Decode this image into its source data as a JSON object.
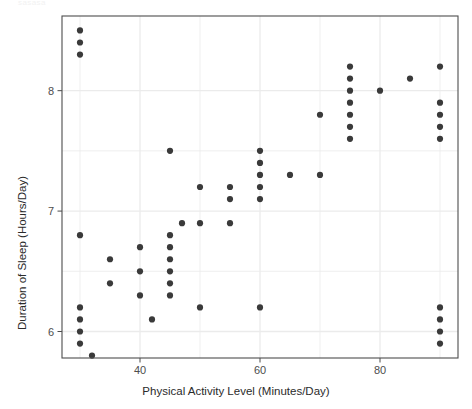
{
  "figure": {
    "faint_header_text": "sasasa",
    "background": "#ffffff",
    "panel_background": "#ffffff",
    "panel_border_color": "#4d4d4d",
    "grid_color": "#ebebeb",
    "point_color": "#3a3a3a",
    "tick_label_color": "#4d4d4d",
    "axis_label_color": "#2b2b2b"
  },
  "chart_data": {
    "type": "scatter",
    "title": "",
    "xlabel": "Physical Activity Level (Minutes/Day)",
    "ylabel": "Duration of Sleep (Hours/Day)",
    "xlim": [
      27,
      93
    ],
    "ylim": [
      5.78,
      8.62
    ],
    "xticks": [
      40,
      60,
      80
    ],
    "xtick_labels": [
      "40",
      "60",
      "80"
    ],
    "yticks": [
      6,
      7,
      8
    ],
    "ytick_labels": [
      "6",
      "7",
      "8"
    ],
    "x_minor_ticks": [
      30,
      50,
      70,
      90
    ],
    "y_minor_ticks": [
      6.5,
      7.5
    ],
    "grid": true,
    "legend": "none",
    "marker": "filled-circle",
    "marker_size": 3.1,
    "points": [
      {
        "x": 30,
        "y": 8.5
      },
      {
        "x": 30,
        "y": 8.4
      },
      {
        "x": 30,
        "y": 8.3
      },
      {
        "x": 30,
        "y": 6.8
      },
      {
        "x": 30,
        "y": 6.2
      },
      {
        "x": 30,
        "y": 6.1
      },
      {
        "x": 30,
        "y": 6.0
      },
      {
        "x": 30,
        "y": 5.9
      },
      {
        "x": 32,
        "y": 5.8
      },
      {
        "x": 35,
        "y": 6.6
      },
      {
        "x": 35,
        "y": 6.4
      },
      {
        "x": 40,
        "y": 6.7
      },
      {
        "x": 40,
        "y": 6.5
      },
      {
        "x": 40,
        "y": 6.3
      },
      {
        "x": 42,
        "y": 6.1
      },
      {
        "x": 45,
        "y": 7.5
      },
      {
        "x": 45,
        "y": 6.8
      },
      {
        "x": 45,
        "y": 6.7
      },
      {
        "x": 45,
        "y": 6.6
      },
      {
        "x": 45,
        "y": 6.5
      },
      {
        "x": 45,
        "y": 6.4
      },
      {
        "x": 45,
        "y": 6.3
      },
      {
        "x": 47,
        "y": 6.9
      },
      {
        "x": 50,
        "y": 7.2
      },
      {
        "x": 50,
        "y": 6.9
      },
      {
        "x": 50,
        "y": 6.2
      },
      {
        "x": 55,
        "y": 7.2
      },
      {
        "x": 55,
        "y": 7.1
      },
      {
        "x": 55,
        "y": 6.9
      },
      {
        "x": 60,
        "y": 7.5
      },
      {
        "x": 60,
        "y": 7.4
      },
      {
        "x": 60,
        "y": 7.3
      },
      {
        "x": 60,
        "y": 7.2
      },
      {
        "x": 60,
        "y": 7.1
      },
      {
        "x": 60,
        "y": 6.2
      },
      {
        "x": 65,
        "y": 7.3
      },
      {
        "x": 70,
        "y": 7.8
      },
      {
        "x": 70,
        "y": 7.3
      },
      {
        "x": 75,
        "y": 8.2
      },
      {
        "x": 75,
        "y": 8.1
      },
      {
        "x": 75,
        "y": 8.0
      },
      {
        "x": 75,
        "y": 7.9
      },
      {
        "x": 75,
        "y": 7.8
      },
      {
        "x": 75,
        "y": 7.7
      },
      {
        "x": 75,
        "y": 7.6
      },
      {
        "x": 80,
        "y": 8.0
      },
      {
        "x": 85,
        "y": 8.1
      },
      {
        "x": 90,
        "y": 8.2
      },
      {
        "x": 90,
        "y": 7.9
      },
      {
        "x": 90,
        "y": 7.8
      },
      {
        "x": 90,
        "y": 7.7
      },
      {
        "x": 90,
        "y": 7.6
      },
      {
        "x": 90,
        "y": 6.2
      },
      {
        "x": 90,
        "y": 6.1
      },
      {
        "x": 90,
        "y": 6.0
      },
      {
        "x": 90,
        "y": 5.9
      }
    ]
  }
}
